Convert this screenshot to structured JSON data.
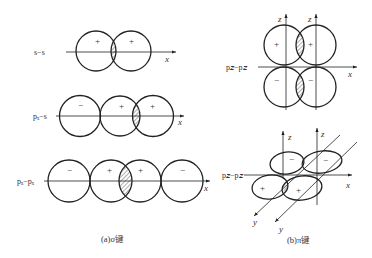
{
  "panel_a": {
    "caption": "(a)σ键",
    "rows": [
      {
        "label": "s−s",
        "axis_label": "x",
        "signs": [
          "+",
          "+"
        ]
      },
      {
        "label": "pₓ−s",
        "axis_label": "x",
        "signs": [
          "−",
          "+",
          "+"
        ]
      },
      {
        "label": "pₓ−pₓ",
        "axis_label": "x",
        "signs": [
          "−",
          "+",
          "+",
          "−"
        ]
      }
    ]
  },
  "panel_b": {
    "caption": "(b)π键",
    "top": {
      "label": "p𝑧−p𝑧",
      "axis_x": "x",
      "axis_z1": "z",
      "axis_z2": "z",
      "signs": [
        "+",
        "+",
        "−",
        "−"
      ]
    },
    "bottom": {
      "label": "p𝑧−p𝑧",
      "axis_x": "x",
      "axis_z1": "z",
      "axis_z2": "z",
      "axis_y1": "y",
      "axis_y2": "y",
      "signs": [
        "−",
        "−",
        "+",
        "+"
      ]
    }
  }
}
